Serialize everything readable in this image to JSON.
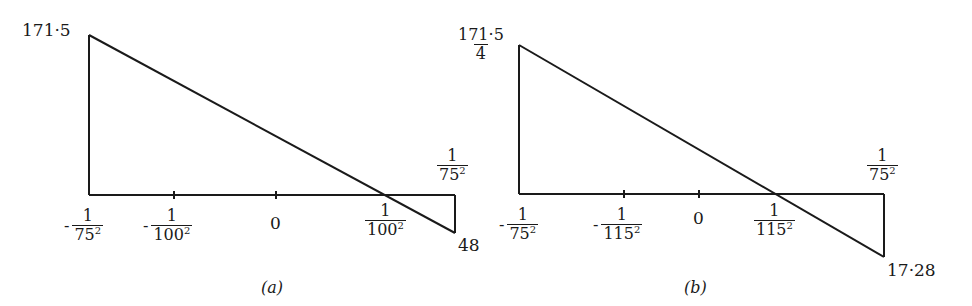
{
  "figures": [
    {
      "id": "a",
      "caption": "(a)",
      "top_value_label": "171·5",
      "bottom_value_label": "48",
      "right_top_label": {
        "num": "1",
        "den": "75",
        "exp": "2"
      },
      "axis_ticks": [
        {
          "sign": "-",
          "num": "1",
          "den": "75",
          "exp": "2"
        },
        {
          "sign": "-",
          "num": "1",
          "den": "100",
          "exp": "2"
        },
        {
          "plain": "0"
        },
        {
          "sign": "",
          "num": "1",
          "den": "100",
          "exp": "2"
        }
      ]
    },
    {
      "id": "b",
      "caption": "(b)",
      "top_value_label": {
        "num": "171·5",
        "den": "4"
      },
      "bottom_value_label": "17·28",
      "right_top_label": {
        "num": "1",
        "den": "75",
        "exp": "2"
      },
      "axis_ticks": [
        {
          "sign": "-",
          "num": "1",
          "den": "75",
          "exp": "2"
        },
        {
          "sign": "-",
          "num": "1",
          "den": "115",
          "exp": "2"
        },
        {
          "plain": "0"
        },
        {
          "sign": "",
          "num": "1",
          "den": "115",
          "exp": "2"
        }
      ]
    }
  ]
}
